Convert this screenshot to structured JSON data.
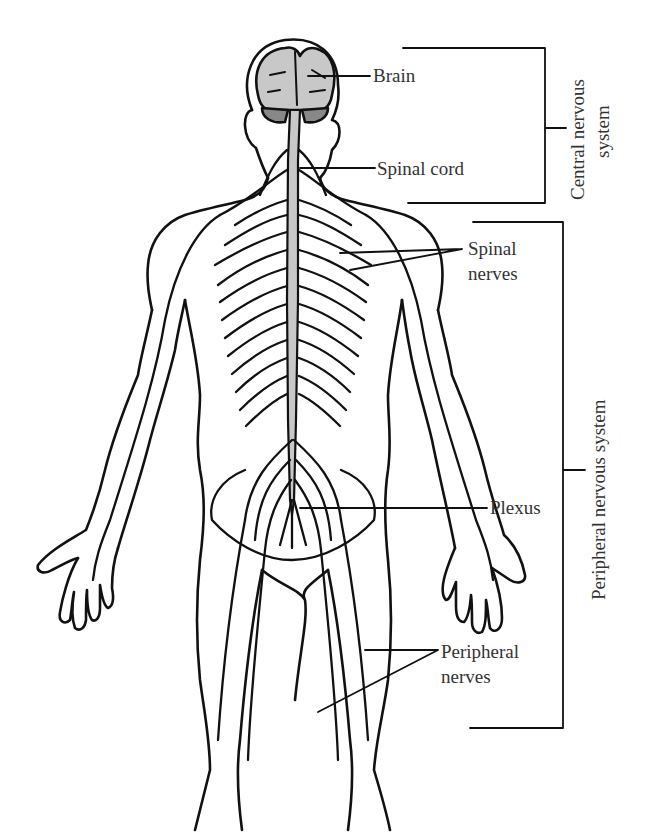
{
  "diagram": {
    "labels": {
      "brain": "Brain",
      "spinal_cord": "Spinal cord",
      "spinal_nerves_line1": "Spinal",
      "spinal_nerves_line2": "nerves",
      "plexus": "Plexus",
      "peripheral_nerves_line1": "Peripheral",
      "peripheral_nerves_line2": "nerves"
    },
    "groups": {
      "cns_line1": "Central nervous",
      "cns_line2": "system",
      "pns": "Peripheral nervous system"
    },
    "colors": {
      "line": "#111111",
      "cns_fill": "#c8c8c8",
      "text": "#333333",
      "background": "#ffffff"
    }
  }
}
